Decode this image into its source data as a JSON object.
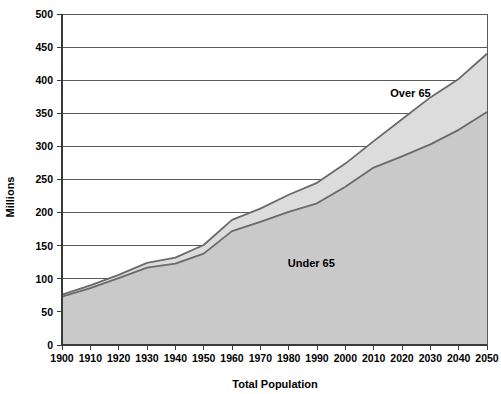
{
  "chart_data": {
    "type": "area",
    "title": "",
    "subtitle": "",
    "xlabel": "Total Population",
    "ylabel": "Millions",
    "x": [
      1900,
      1910,
      1920,
      1930,
      1940,
      1950,
      1960,
      1970,
      1980,
      1990,
      2000,
      2010,
      2020,
      2030,
      2040,
      2050
    ],
    "categories": [
      "1900",
      "1910",
      "1920",
      "1930",
      "1940",
      "1950",
      "1960",
      "1970",
      "1980",
      "1990",
      "2000",
      "2010",
      "2020",
      "2030",
      "2040",
      "2050"
    ],
    "xlim": [
      1900,
      2050
    ],
    "ylim": [
      0,
      500
    ],
    "y_ticks": [
      0,
      50,
      100,
      150,
      200,
      250,
      300,
      350,
      400,
      450,
      500
    ],
    "y_tick_labels": [
      "0",
      "50",
      "100",
      "150",
      "200",
      "250",
      "300",
      "350",
      "400",
      "450",
      "500"
    ],
    "grid": true,
    "grid_axis": "y",
    "legend": "inline-annotations",
    "stacked": true,
    "series": [
      {
        "name": "Under 65",
        "label": "Under 65",
        "color": "#c9c9c9",
        "stroke": "#6a6a6a",
        "values": [
          73,
          86,
          101,
          117,
          123,
          138,
          172,
          186,
          201,
          214,
          239,
          268,
          285,
          303,
          325,
          352
        ]
      },
      {
        "name": "Over 65",
        "label": "Over 65",
        "color": "#dcdcdc",
        "stroke": "#9a9a9a",
        "values": [
          3,
          4,
          5,
          7,
          9,
          13,
          17,
          20,
          26,
          31,
          35,
          40,
          56,
          71,
          77,
          88
        ]
      }
    ],
    "total": [
      76,
      90,
      106,
      124,
      132,
      151,
      189,
      206,
      227,
      245,
      274,
      308,
      341,
      374,
      402,
      440
    ],
    "annotations": [
      {
        "text": "Over 65",
        "x": 2023,
        "y": 375
      },
      {
        "text": "Under 65",
        "x": 1988,
        "y": 118
      }
    ]
  },
  "axes": {
    "y_axis_title": "Millions",
    "x_axis_title": "Total Population"
  },
  "colors": {
    "under65_fill": "#c9c9c9",
    "over65_fill": "#dcdcdc",
    "line": "#6a6a6a",
    "grid": "#5b5b5b",
    "axis": "#3a3a3a",
    "background": "#ffffff",
    "text": "#000000"
  }
}
